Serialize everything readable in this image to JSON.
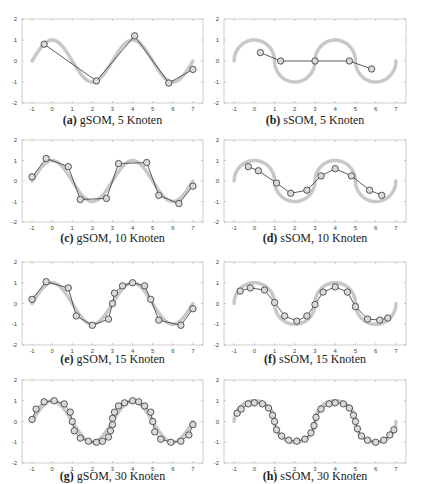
{
  "figure": {
    "panels": [
      {
        "id": "a",
        "label": "(a)",
        "caption": "gSOM, 5 Knoten"
      },
      {
        "id": "b",
        "label": "(b)",
        "caption": "sSOM, 5 Knoten"
      },
      {
        "id": "c",
        "label": "(c)",
        "caption": "gSOM, 10 Knoten"
      },
      {
        "id": "d",
        "label": "(d)",
        "caption": "sSOM, 10 Knoten"
      },
      {
        "id": "e",
        "label": "(e)",
        "caption": "gSOM, 15 Knoten"
      },
      {
        "id": "f",
        "label": "(f)",
        "caption": "sSOM, 15 Knoten"
      },
      {
        "id": "g",
        "label": "(g)",
        "caption": "gSOM, 30 Knoten"
      },
      {
        "id": "h",
        "label": "(h)",
        "caption": "sSOM, 30 Knoten"
      }
    ]
  },
  "colors": {
    "reference_curve": "#c8c8c8",
    "som_line": "#333333",
    "node_fill": "#d9d9d9",
    "node_stroke": "#333333",
    "axis": "#888888"
  },
  "chart_data": [
    {
      "type": "line",
      "title": "(a) gSOM, 5 Knoten",
      "xlabel": "",
      "ylabel": "",
      "xlim": [
        -1.5,
        7.5
      ],
      "ylim": [
        -2,
        2
      ],
      "xticks": [
        -1,
        0,
        1,
        2,
        3,
        4,
        5,
        6,
        7
      ],
      "yticks": [
        -2,
        -1,
        0,
        1,
        2
      ],
      "grid": false,
      "reference": "sin curve y=sin(x) from x=-1 to 7 (gray)",
      "x": [
        -0.4,
        2.2,
        4.1,
        5.8,
        7.0
      ],
      "y": [
        0.8,
        -0.95,
        1.2,
        -1.05,
        -0.4
      ]
    },
    {
      "type": "line",
      "title": "(b) sSOM, 5 Knoten",
      "xlabel": "",
      "ylabel": "",
      "xlim": [
        -1.5,
        7.5
      ],
      "ylim": [
        -2,
        2
      ],
      "xticks": [
        -1,
        0,
        1,
        2,
        3,
        4,
        5,
        6,
        7
      ],
      "yticks": [
        -2,
        -1,
        0,
        1,
        2
      ],
      "grid": false,
      "reference": "semicircle chain (gray)",
      "x": [
        0.3,
        1.3,
        3.0,
        4.7,
        5.8
      ],
      "y": [
        0.4,
        0.0,
        0.0,
        0.0,
        -0.38
      ]
    },
    {
      "type": "line",
      "title": "(c) gSOM, 10 Knoten",
      "xlabel": "",
      "ylabel": "",
      "xlim": [
        -1.5,
        7.5
      ],
      "ylim": [
        -2,
        2
      ],
      "xticks": [
        -1,
        0,
        1,
        2,
        3,
        4,
        5,
        6,
        7
      ],
      "yticks": [
        -2,
        -1,
        0,
        1,
        2
      ],
      "grid": false,
      "x": [
        -1.0,
        -0.3,
        0.8,
        1.4,
        2.7,
        3.3,
        4.7,
        5.3,
        6.3,
        7.0
      ],
      "y": [
        0.2,
        1.1,
        0.7,
        -0.9,
        -0.85,
        0.85,
        0.9,
        -0.7,
        -1.1,
        -0.25
      ]
    },
    {
      "type": "line",
      "title": "(d) sSOM, 10 Knoten",
      "xlabel": "",
      "ylabel": "",
      "xlim": [
        -1.5,
        7.5
      ],
      "ylim": [
        -2,
        2
      ],
      "xticks": [
        -1,
        0,
        1,
        2,
        3,
        4,
        5,
        6,
        7
      ],
      "yticks": [
        -2,
        -1,
        0,
        1,
        2
      ],
      "grid": false,
      "x": [
        -0.3,
        0.2,
        1.1,
        1.8,
        2.6,
        3.3,
        4.0,
        4.8,
        5.7,
        6.3
      ],
      "y": [
        0.7,
        0.5,
        -0.1,
        -0.6,
        -0.45,
        0.25,
        0.6,
        0.25,
        -0.45,
        -0.7
      ]
    },
    {
      "type": "line",
      "title": "(e) gSOM, 15 Knoten",
      "xlabel": "",
      "ylabel": "",
      "xlim": [
        -1.5,
        7.5
      ],
      "ylim": [
        -2,
        2
      ],
      "xticks": [
        -1,
        0,
        1,
        2,
        3,
        4,
        5,
        6,
        7
      ],
      "yticks": [
        -2,
        -1,
        0,
        1,
        2
      ],
      "grid": false,
      "x": [
        -1.0,
        -0.3,
        0.8,
        1.2,
        2.0,
        2.8,
        3.0,
        3.1,
        3.5,
        4.0,
        4.6,
        4.9,
        5.3,
        6.4,
        7.0
      ],
      "y": [
        0.2,
        1.05,
        0.75,
        -0.6,
        -1.05,
        -0.75,
        0.0,
        0.5,
        0.85,
        1.0,
        0.85,
        0.2,
        -0.8,
        -1.05,
        -0.25
      ]
    },
    {
      "type": "line",
      "title": "(f) sSOM, 15 Knoten",
      "xlabel": "",
      "ylabel": "",
      "xlim": [
        -1.5,
        7.5
      ],
      "ylim": [
        -2,
        2
      ],
      "xticks": [
        -1,
        0,
        1,
        2,
        3,
        4,
        5,
        6,
        7
      ],
      "yticks": [
        -2,
        -1,
        0,
        1,
        2
      ],
      "grid": false,
      "x": [
        -0.7,
        -0.2,
        0.5,
        1.0,
        1.5,
        2.1,
        2.6,
        3.0,
        3.4,
        4.0,
        4.6,
        5.0,
        5.6,
        6.2,
        6.6
      ],
      "y": [
        0.6,
        0.75,
        0.65,
        0.05,
        -0.6,
        -0.85,
        -0.6,
        -0.05,
        0.55,
        0.8,
        0.55,
        -0.15,
        -0.75,
        -0.8,
        -0.7
      ]
    },
    {
      "type": "line",
      "title": "(g) gSOM, 30 Knoten",
      "xlabel": "",
      "ylabel": "",
      "xlim": [
        -1.5,
        7.5
      ],
      "ylim": [
        -2,
        2
      ],
      "xticks": [
        -1,
        0,
        1,
        2,
        3,
        4,
        5,
        6,
        7
      ],
      "yticks": [
        -2,
        -1,
        0,
        1,
        2
      ],
      "grid": false,
      "x": [
        -1.0,
        -0.8,
        -0.4,
        0.1,
        0.6,
        0.9,
        1.0,
        1.1,
        1.4,
        1.8,
        2.2,
        2.5,
        2.8,
        2.9,
        3.0,
        3.0,
        3.1,
        3.3,
        3.6,
        4.0,
        4.3,
        4.6,
        4.9,
        5.0,
        5.1,
        5.4,
        5.9,
        6.4,
        6.8,
        7.0
      ],
      "y": [
        0.1,
        0.6,
        0.95,
        1.0,
        0.85,
        0.45,
        0.0,
        -0.45,
        -0.8,
        -0.95,
        -1.0,
        -0.95,
        -0.75,
        -0.45,
        -0.15,
        0.15,
        0.45,
        0.75,
        0.9,
        1.0,
        0.95,
        0.75,
        0.45,
        0.0,
        -0.5,
        -0.85,
        -1.0,
        -0.95,
        -0.65,
        -0.15
      ]
    },
    {
      "type": "line",
      "title": "(h) sSOM, 30 Knoten",
      "xlabel": "",
      "ylabel": "",
      "xlim": [
        -1.5,
        7.5
      ],
      "ylim": [
        -2,
        2
      ],
      "xticks": [
        -1,
        0,
        1,
        2,
        3,
        4,
        5,
        6,
        7
      ],
      "yticks": [
        -2,
        -1,
        0,
        1,
        2
      ],
      "grid": false,
      "x": [
        -0.85,
        -0.65,
        -0.3,
        0.0,
        0.4,
        0.7,
        0.9,
        1.0,
        1.1,
        1.35,
        1.7,
        2.1,
        2.5,
        2.8,
        2.95,
        3.05,
        3.3,
        3.7,
        4.0,
        4.4,
        4.7,
        4.9,
        5.0,
        5.1,
        5.3,
        5.6,
        6.0,
        6.4,
        6.7,
        6.9
      ],
      "y": [
        0.4,
        0.6,
        0.85,
        0.9,
        0.85,
        0.65,
        0.3,
        0.0,
        -0.4,
        -0.7,
        -0.9,
        -0.95,
        -0.85,
        -0.55,
        -0.2,
        0.2,
        0.6,
        0.85,
        0.9,
        0.85,
        0.65,
        0.3,
        0.0,
        -0.35,
        -0.7,
        -0.9,
        -1.0,
        -0.9,
        -0.65,
        -0.4
      ]
    }
  ]
}
